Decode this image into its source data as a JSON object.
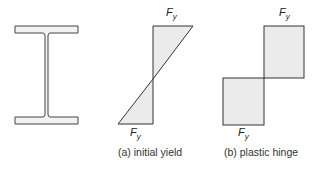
{
  "figure": {
    "ibeam": {
      "name": "I-beam cross section"
    },
    "diagram_a": {
      "top_label_main": "F",
      "top_label_sub": "y",
      "bottom_label_main": "F",
      "bottom_label_sub": "y",
      "caption": "(a) initial yield"
    },
    "diagram_b": {
      "top_label_main": "F",
      "top_label_sub": "y",
      "bottom_label_main": "F",
      "bottom_label_sub": "y",
      "caption": "(b) plastic hinge"
    },
    "colors": {
      "stroke": "#333333",
      "fill": "#ebebeb"
    }
  }
}
